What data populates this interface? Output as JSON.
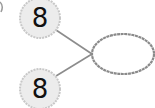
{
  "diagram": {
    "type": "number-bond",
    "parts": [
      {
        "label": "8",
        "cx": 40,
        "cy": 18,
        "r": 20
      },
      {
        "label": "8",
        "cx": 40,
        "cy": 89,
        "r": 20
      }
    ],
    "whole": {
      "label": "",
      "cx": 123,
      "cy": 54,
      "rx": 31,
      "ry": 20
    },
    "colors": {
      "part_fill": "#ececec",
      "part_stroke": "#c8c8c8",
      "whole_fill": "#ffffff",
      "whole_stroke": "#8a8a8a",
      "line": "#8c8c8c",
      "text": "#111111"
    }
  }
}
